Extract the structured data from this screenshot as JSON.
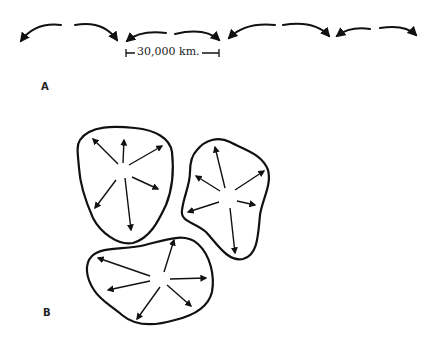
{
  "panels": {
    "a": {
      "label": "A",
      "scale_bar": {
        "text": "30,000 km."
      },
      "description": "Row of paired curved arrows diverging from alternate points"
    },
    "b": {
      "label": "B",
      "description": "Three irregular closed cells each with arrows radiating outward from a central point"
    }
  },
  "colors": {
    "ink": "#111111",
    "background": "#ffffff"
  }
}
